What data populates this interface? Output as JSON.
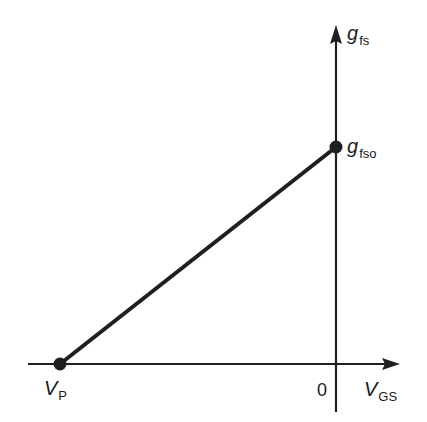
{
  "diagram": {
    "type": "transfer-conductance-plot",
    "axes": {
      "y": {
        "symbol": "g",
        "subscript": "fs"
      },
      "x": {
        "symbol": "V",
        "subscript": "GS"
      },
      "origin_label": "0"
    },
    "points": [
      {
        "name": "Vp",
        "symbol": "V",
        "subscript": "P"
      },
      {
        "name": "gfso",
        "symbol": "g",
        "subscript": "fso"
      }
    ],
    "line_color": "#1f1f1f"
  }
}
